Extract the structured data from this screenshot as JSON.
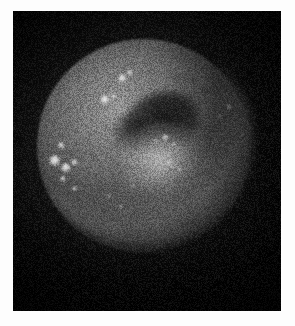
{
  "page": {
    "background_color": "#fdfdfd",
    "width": 295,
    "height": 326
  },
  "figure": {
    "name": "grayscale-circular-field-image",
    "modality_appearance": "monochrome circular illuminated field with speckle noise",
    "panel": {
      "x": 13,
      "y": 11,
      "width": 268,
      "height": 300,
      "background_color": "#050505",
      "border_color": "#0a0a0a"
    },
    "caption": "",
    "title": "",
    "labels": [],
    "annotations": [],
    "scale_bar": null
  },
  "chart_data": {
    "type": "heatmap",
    "title": "",
    "xlabel": "",
    "ylabel": "",
    "colormap": "grayscale",
    "value_range": [
      0,
      255
    ],
    "grid": false,
    "legend": "none",
    "field_of_view": {
      "shape": "circle",
      "center_x": 131,
      "center_y": 135,
      "radius": 107,
      "peak_intensity": 150,
      "edge_intensity": 12
    },
    "regions": [
      {
        "name": "bright-upper-left-rim-arc",
        "center_x": 96,
        "center_y": 80,
        "intensity": 176,
        "shape": "arc"
      },
      {
        "name": "dark-crescent-lesion",
        "center_x": 149,
        "center_y": 110,
        "intensity": 14,
        "shape": "crescent"
      },
      {
        "name": "bright-mottled-core",
        "center_x": 152,
        "center_y": 151,
        "intensity": 196,
        "shape": "ellipse"
      },
      {
        "name": "lower-left-haze",
        "center_x": 119,
        "center_y": 204,
        "intensity": 92,
        "shape": "ellipse"
      },
      {
        "name": "right-falloff-shadow",
        "center_x": 225,
        "center_y": 150,
        "intensity": 18,
        "shape": "gradient"
      },
      {
        "name": "bottom-falloff-shadow",
        "center_x": 134,
        "center_y": 270,
        "intensity": 10,
        "shape": "gradient"
      }
    ],
    "bright_spots": [
      {
        "id": 1,
        "x": 109,
        "y": 67,
        "size": 9,
        "intensity": 242
      },
      {
        "id": 2,
        "x": 117,
        "y": 62,
        "size": 6,
        "intensity": 226
      },
      {
        "id": 3,
        "x": 92,
        "y": 89,
        "size": 10,
        "intensity": 250
      },
      {
        "id": 4,
        "x": 100,
        "y": 85,
        "size": 5,
        "intensity": 218
      },
      {
        "id": 5,
        "x": 48,
        "y": 134,
        "size": 7,
        "intensity": 234
      },
      {
        "id": 6,
        "x": 42,
        "y": 150,
        "size": 12,
        "intensity": 255
      },
      {
        "id": 7,
        "x": 53,
        "y": 157,
        "size": 10,
        "intensity": 250
      },
      {
        "id": 8,
        "x": 61,
        "y": 151,
        "size": 7,
        "intensity": 232
      },
      {
        "id": 9,
        "x": 50,
        "y": 168,
        "size": 6,
        "intensity": 214
      },
      {
        "id": 10,
        "x": 61,
        "y": 177,
        "size": 5,
        "intensity": 200
      },
      {
        "id": 11,
        "x": 152,
        "y": 126,
        "size": 7,
        "intensity": 222
      },
      {
        "id": 12,
        "x": 160,
        "y": 133,
        "size": 5,
        "intensity": 206
      },
      {
        "id": 13,
        "x": 156,
        "y": 152,
        "size": 6,
        "intensity": 210
      },
      {
        "id": 14,
        "x": 166,
        "y": 159,
        "size": 5,
        "intensity": 196
      },
      {
        "id": 15,
        "x": 143,
        "y": 130,
        "size": 4,
        "intensity": 190
      },
      {
        "id": 16,
        "x": 216,
        "y": 96,
        "size": 6,
        "intensity": 150
      },
      {
        "id": 17,
        "x": 207,
        "y": 106,
        "size": 4,
        "intensity": 128
      },
      {
        "id": 18,
        "x": 108,
        "y": 196,
        "size": 4,
        "intensity": 150
      },
      {
        "id": 19,
        "x": 96,
        "y": 185,
        "size": 4,
        "intensity": 142
      },
      {
        "id": 20,
        "x": 120,
        "y": 175,
        "size": 4,
        "intensity": 146
      }
    ],
    "noise": {
      "type": "speckle",
      "visible": true,
      "strength": "high"
    }
  }
}
